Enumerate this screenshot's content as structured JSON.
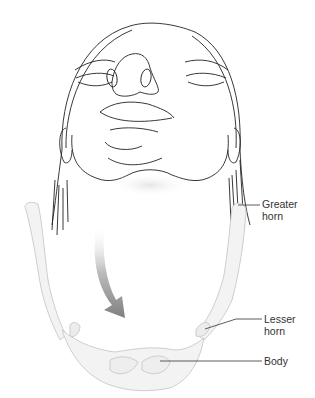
{
  "figure": {
    "labels": {
      "greater_horn": {
        "line1": "Greater",
        "line2": "horn"
      },
      "lesser_horn": {
        "line1": "Lesser",
        "line2": "horn"
      },
      "body": {
        "line1": "Body"
      }
    },
    "colors": {
      "line_art": "#222222",
      "bone_fill": "#f2f2f2",
      "bone_outline": "#c8c8c8",
      "arrow": "#8a8a8a",
      "leader": "#333333"
    }
  }
}
